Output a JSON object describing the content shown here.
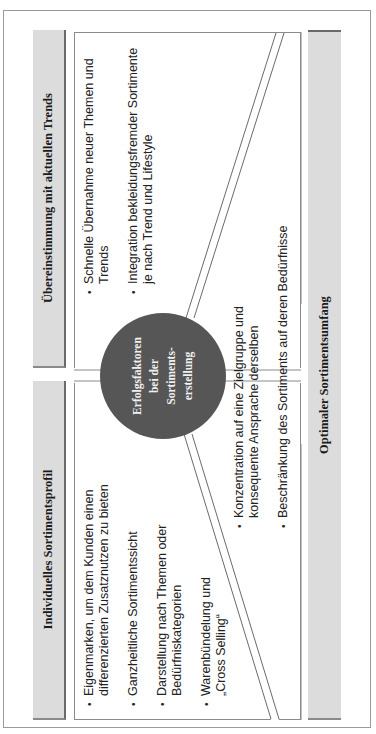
{
  "diagram": {
    "center": {
      "label_lines": [
        "Erfolgsfaktoren",
        "bei der",
        "Sortiments-",
        "erstellung"
      ],
      "color": "#565656"
    },
    "quadrants": {
      "top_left": {
        "header": "Individuelles Sortimentsprofil",
        "items": [
          "Eigenmarken, um dem Kunden einen differenzierten Zusatznutzen zu bieten",
          "Ganzheitliche Sortimentssicht",
          "Darstellung nach Themen oder Bedürfniskategorien",
          "Warenbündelung und „Cross Selling“"
        ]
      },
      "top_right": {
        "header": "Übereinstimmung mit aktuellen Trends",
        "items": [
          "Schnelle Übernahme neuer Themen und Trends",
          "Integration bekleidungsfremder Sortimente je nach Trend und Lifestyle"
        ]
      },
      "bottom": {
        "header": "Optimaler Sortimentsumfang",
        "items": [
          "Konzentration auf eine Zielgruppe und konsequente Ansprache derselben",
          "Beschränkung des Sortiments auf deren Bedürfnisse"
        ]
      }
    },
    "colors": {
      "header_bg": "#dcdcdc",
      "border": "#8a8a8a"
    }
  }
}
